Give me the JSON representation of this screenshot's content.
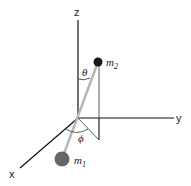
{
  "diagram": {
    "axes": {
      "x": "x",
      "y": "y",
      "z": "z"
    },
    "masses": {
      "m1": {
        "label": "m",
        "sub": "1"
      },
      "m2": {
        "label": "m",
        "sub": "2"
      }
    },
    "angles": {
      "theta": "θ",
      "phi": "ϕ"
    },
    "colors": {
      "axis": "#111111",
      "rod": "#b5b5b5",
      "m1": "#666666",
      "m2": "#1a1a1a",
      "guide": "#333333"
    }
  }
}
